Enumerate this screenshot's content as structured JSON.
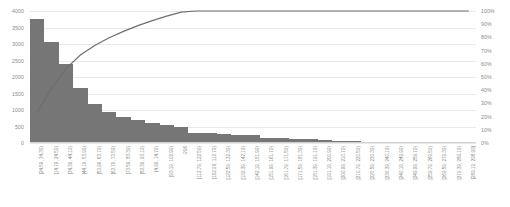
{
  "chart_data": {
    "type": "bar",
    "title": "",
    "subtitle": "",
    "xlabel": "",
    "ylabel": "",
    "y2label": "",
    "grid": true,
    "legend": "none",
    "ylim": [
      0,
      4000
    ],
    "y2lim": [
      0,
      100
    ],
    "y_ticks": [
      "0",
      "500",
      "1000",
      "1500",
      "2000",
      "2500",
      "3000",
      "3500",
      "4000"
    ],
    "y_tick_values": [
      0,
      500,
      1000,
      1500,
      2000,
      2500,
      3000,
      3500,
      4000
    ],
    "y2_ticks": [
      "0%",
      "10%",
      "20%",
      "30%",
      "40%",
      "50%",
      "60%",
      "70%",
      "80%",
      "90%",
      "100%"
    ],
    "y2_tick_values": [
      0,
      10,
      20,
      30,
      40,
      50,
      60,
      70,
      80,
      90,
      100
    ],
    "bar_color": "#767676",
    "line_color": "#6e6e6e",
    "grid_color": "#e9e9e9",
    "axis_text_color": "#8a8a8a",
    "categories": [
      "[24.59, 34.39)",
      "[14.79, 24.59)",
      "[34.39, 44.19)",
      "[44.19, 53.99)",
      "[53.99, 63.79)",
      "[63.79, 73.59)",
      "[73.59, 83.39)",
      "[83.39, 93.19)",
      "[4.99, 14.79)",
      "[93.19, 102.99)",
      "-296",
      "[112.79, 122.59)",
      "[102.99, 112.79)",
      "[122.59, 132.39)",
      "[132.39, 142.19)",
      "[142.19, 151.99)",
      "[151.99, 161.79)",
      "[161.79, 171.59)",
      "[171.59, 181.39)",
      "[181.39, 191.19)",
      "[191.19, 200.99)",
      "[200.99, 210.79)",
      "[210.79, 220.59)",
      "[220.59, 230.39)",
      "[230.39, 240.19)",
      "[240.19, 249.99)",
      "[249.99, 259.79)",
      "[259.79, 269.59)",
      "[269.59, 279.39)",
      "[279.39, 289.19)",
      "[289.19, 298.99]"
    ],
    "series": [
      {
        "name": "Count",
        "type": "bar",
        "axis": "left",
        "values": [
          3750,
          3050,
          2380,
          1680,
          1180,
          950,
          800,
          700,
          620,
          560,
          480,
          300,
          290,
          270,
          250,
          230,
          150,
          140,
          130,
          120,
          90,
          60,
          50,
          40,
          30,
          25,
          20,
          15,
          10,
          8,
          5
        ]
      },
      {
        "name": "Cumulative %",
        "type": "line",
        "axis": "right",
        "values": [
          23.0,
          41.7,
          56.3,
          66.6,
          73.8,
          79.7,
          84.6,
          88.9,
          92.7,
          96.1,
          99.1,
          100.9,
          102.7,
          104.3,
          105.9,
          107.3,
          108.2,
          109.1,
          109.9,
          110.6,
          111.2,
          111.5,
          111.8,
          112.1,
          112.3,
          112.4,
          112.6,
          112.7,
          112.8,
          112.8,
          112.9
        ]
      }
    ]
  }
}
